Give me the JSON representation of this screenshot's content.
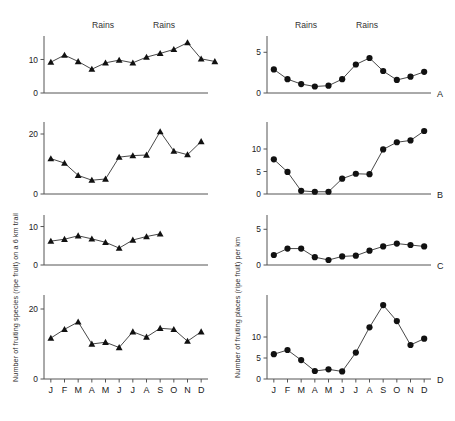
{
  "figure": {
    "left_axis_label": "Number of fruiting species (ripe fruit) on a 6 km trail",
    "right_axis_label": "Number of fruiting places (ripe fruit) per km",
    "rains_label_1": "Rains",
    "rains_label_2": "Rains",
    "rains_label_3": "Rains",
    "rains_label_4": "Rains",
    "panel_letters": [
      "A",
      "B",
      "C",
      "D"
    ],
    "months": [
      "J",
      "F",
      "M",
      "A",
      "M",
      "J",
      "J",
      "A",
      "S",
      "O",
      "N",
      "D"
    ]
  },
  "chart_data": [
    {
      "type": "line",
      "panel": "A",
      "column": "left",
      "title": "",
      "xlabel": "",
      "ylabel": "Number of fruiting species (ripe fruit) on a 6 km trail",
      "categories": [
        "J",
        "F",
        "M",
        "A",
        "M",
        "J",
        "J",
        "A",
        "S",
        "O",
        "N",
        "D"
      ],
      "x": [
        1,
        1.5,
        2.2,
        3,
        3.7,
        4.4,
        5.2,
        5.9,
        6.6,
        7.4,
        8.2,
        8.9,
        9.6,
        10.4,
        11.2,
        12
      ],
      "values": [
        9.2,
        11.3,
        9.4,
        7.1,
        9.0,
        9.8,
        9.0,
        10.7,
        11.8,
        13.0,
        15.0,
        10.2,
        9.4
      ],
      "ylim": [
        0,
        17
      ],
      "yticks": [
        0,
        10
      ],
      "ytick_labels": [
        "0",
        "10"
      ],
      "marker": "triangle",
      "grid": false,
      "legend": "none"
    },
    {
      "type": "line",
      "panel": "B",
      "column": "left",
      "title": "",
      "xlabel": "",
      "ylabel": "",
      "categories": [
        "J",
        "F",
        "M",
        "A",
        "M",
        "J",
        "J",
        "A",
        "S",
        "O",
        "N",
        "D"
      ],
      "values": [
        11.8,
        10.3,
        6.2,
        4.6,
        5.0,
        12.3,
        12.8,
        13.0,
        20.8,
        14.3,
        13.1,
        17.5
      ],
      "ylim": [
        0,
        24
      ],
      "yticks": [
        0,
        20
      ],
      "ytick_labels": [
        "0",
        "20"
      ],
      "marker": "triangle",
      "grid": false,
      "legend": "none"
    },
    {
      "type": "line",
      "panel": "C",
      "column": "left",
      "title": "",
      "xlabel": "",
      "ylabel": "",
      "categories": [
        "J",
        "F",
        "M",
        "A",
        "M",
        "J",
        "J",
        "A",
        "S"
      ],
      "values": [
        6.2,
        6.7,
        7.6,
        6.8,
        5.9,
        4.4,
        6.5,
        7.4,
        8.1
      ],
      "ylim": [
        0,
        13
      ],
      "yticks": [
        0,
        10
      ],
      "ytick_labels": [
        "0",
        "10"
      ],
      "marker": "triangle",
      "grid": false,
      "legend": "none"
    },
    {
      "type": "line",
      "panel": "D",
      "column": "left",
      "title": "",
      "xlabel": "",
      "ylabel": "",
      "categories": [
        "J",
        "F",
        "M",
        "A",
        "M",
        "J",
        "J",
        "A",
        "S",
        "O",
        "N",
        "D"
      ],
      "values": [
        11.7,
        14.2,
        16.3,
        10.0,
        10.5,
        9.0,
        13.5,
        12.0,
        14.5,
        14.2,
        10.8,
        13.5
      ],
      "ylim": [
        0,
        24
      ],
      "yticks": [
        0,
        20
      ],
      "ytick_labels": [
        "0",
        "20"
      ],
      "marker": "triangle",
      "grid": false,
      "legend": "none"
    },
    {
      "type": "line",
      "panel": "A",
      "column": "right",
      "title": "",
      "xlabel": "",
      "ylabel": "Number of fruiting places (ripe fruit) per km",
      "categories": [
        "J",
        "F",
        "M",
        "A",
        "M",
        "J",
        "J",
        "A",
        "S",
        "O",
        "N",
        "D"
      ],
      "values": [
        2.9,
        1.7,
        1.1,
        0.8,
        0.9,
        1.7,
        3.5,
        4.3,
        2.7,
        1.6,
        2.0,
        2.6
      ],
      "ylim": [
        0,
        7
      ],
      "yticks": [
        0,
        5
      ],
      "ytick_labels": [
        "0",
        "5"
      ],
      "marker": "circle",
      "grid": false,
      "legend": "none"
    },
    {
      "type": "line",
      "panel": "B",
      "column": "right",
      "title": "",
      "xlabel": "",
      "ylabel": "",
      "categories": [
        "J",
        "F",
        "M",
        "A",
        "M",
        "J",
        "J",
        "A",
        "S",
        "O",
        "N",
        "D"
      ],
      "values": [
        7.7,
        4.9,
        0.7,
        0.5,
        0.5,
        3.4,
        4.5,
        4.4,
        9.9,
        11.5,
        11.9,
        14.0
      ],
      "ylim": [
        0,
        16
      ],
      "yticks": [
        0,
        5,
        10
      ],
      "ytick_labels": [
        "0",
        "5",
        "10"
      ],
      "marker": "circle",
      "grid": false,
      "legend": "none"
    },
    {
      "type": "line",
      "panel": "C",
      "column": "right",
      "title": "",
      "xlabel": "",
      "ylabel": "",
      "categories": [
        "J",
        "F",
        "M",
        "A",
        "M",
        "J",
        "J",
        "A",
        "S",
        "O",
        "N",
        "D"
      ],
      "values": [
        1.4,
        2.3,
        2.3,
        1.1,
        0.7,
        1.2,
        1.3,
        2.0,
        2.6,
        3.0,
        2.8,
        2.6
      ],
      "ylim": [
        0,
        7
      ],
      "yticks": [
        0,
        5
      ],
      "ytick_labels": [
        "0",
        "5"
      ],
      "marker": "circle",
      "grid": false,
      "legend": "none"
    },
    {
      "type": "line",
      "panel": "D",
      "column": "right",
      "title": "",
      "xlabel": "",
      "ylabel": "",
      "categories": [
        "J",
        "F",
        "M",
        "A",
        "M",
        "J",
        "J",
        "A",
        "S",
        "O",
        "N",
        "D"
      ],
      "values": [
        5.9,
        6.9,
        4.5,
        1.9,
        2.3,
        1.8,
        6.3,
        12.3,
        17.6,
        13.8,
        8.1,
        9.6
      ],
      "ylim": [
        0,
        20
      ],
      "yticks": [
        0,
        5,
        10
      ],
      "ytick_labels": [
        "0",
        "5",
        "10"
      ],
      "marker": "circle",
      "grid": false,
      "legend": "none"
    }
  ]
}
